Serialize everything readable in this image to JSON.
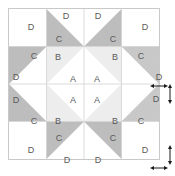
{
  "diagram": {
    "grid_columns": 4,
    "grid_rows": 4,
    "colors": {
      "background_fabric": "#ffffff",
      "light_fabric": "#ededed",
      "medium_fabric": "#c9c9c9",
      "dark_fabric": "#bdbdbd",
      "speckled_fabric": "#c4c4c4",
      "line": "#c9c9c9",
      "label_text": "#5a5a5a",
      "arrow": "#1a1a1a"
    },
    "patch_labels": [
      {
        "id": "p1",
        "label": "D",
        "x": 30,
        "y": 26
      },
      {
        "id": "p2",
        "label": "D",
        "x": 65,
        "y": 15
      },
      {
        "id": "p3",
        "label": "D",
        "x": 97,
        "y": 15
      },
      {
        "id": "p4",
        "label": "D",
        "x": 144,
        "y": 26
      },
      {
        "id": "p5",
        "label": "C",
        "x": 58,
        "y": 38
      },
      {
        "id": "p6",
        "label": "C",
        "x": 112,
        "y": 38
      },
      {
        "id": "p7",
        "label": "C",
        "x": 33,
        "y": 55
      },
      {
        "id": "p8",
        "label": "B",
        "x": 57,
        "y": 56
      },
      {
        "id": "p9",
        "label": "B",
        "x": 114,
        "y": 56
      },
      {
        "id": "p10",
        "label": "C",
        "x": 140,
        "y": 55
      },
      {
        "id": "p11",
        "label": "D",
        "x": 15,
        "y": 76
      },
      {
        "id": "p12",
        "label": "A",
        "x": 72,
        "y": 78
      },
      {
        "id": "p13",
        "label": "A",
        "x": 96,
        "y": 78
      },
      {
        "id": "p14",
        "label": "D",
        "x": 158,
        "y": 76
      },
      {
        "id": "p15",
        "label": "D",
        "x": 15,
        "y": 99
      },
      {
        "id": "p16",
        "label": "A",
        "x": 72,
        "y": 99
      },
      {
        "id": "p17",
        "label": "A",
        "x": 96,
        "y": 99
      },
      {
        "id": "p18",
        "label": "D",
        "x": 155,
        "y": 98
      },
      {
        "id": "p19",
        "label": "C",
        "x": 33,
        "y": 120
      },
      {
        "id": "p20",
        "label": "B",
        "x": 57,
        "y": 120
      },
      {
        "id": "p21",
        "label": "B",
        "x": 114,
        "y": 120
      },
      {
        "id": "p22",
        "label": "C",
        "x": 140,
        "y": 120
      },
      {
        "id": "p23",
        "label": "C",
        "x": 58,
        "y": 137
      },
      {
        "id": "p24",
        "label": "C",
        "x": 112,
        "y": 137
      },
      {
        "id": "p25",
        "label": "D",
        "x": 30,
        "y": 149
      },
      {
        "id": "p26",
        "label": "D",
        "x": 66,
        "y": 159
      },
      {
        "id": "p27",
        "label": "D",
        "x": 97,
        "y": 159
      },
      {
        "id": "p28",
        "label": "D",
        "x": 144,
        "y": 149
      }
    ],
    "dimension_markers": [
      {
        "id": "seam-width-upper",
        "orientation": "horizontal",
        "x": 152,
        "y": 88
      },
      {
        "id": "seam-height-upper",
        "orientation": "vertical",
        "x": 170,
        "y": 90
      },
      {
        "id": "seam-height-lower",
        "orientation": "vertical",
        "x": 170,
        "y": 152
      },
      {
        "id": "seam-width-lower",
        "orientation": "horizontal",
        "x": 152,
        "y": 170
      }
    ]
  }
}
